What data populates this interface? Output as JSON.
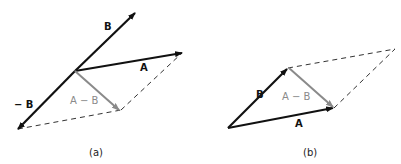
{
  "colors": {
    "vector": "#111111",
    "difference": "#8a8a8a",
    "dashed": "#333333",
    "background": "#ffffff"
  },
  "panels": [
    {
      "caption": "(a)",
      "labels": {
        "B": "B",
        "A": "A",
        "negB": "− B",
        "diff": "A − B"
      },
      "points": {
        "origin": [
          75,
          71
        ],
        "B_tip": [
          135,
          13
        ],
        "A_tip": [
          182,
          53
        ],
        "negB_tip": [
          18,
          129
        ],
        "diff_tip": [
          119,
          110
        ]
      }
    },
    {
      "caption": "(b)",
      "labels": {
        "B": "B",
        "A": "A",
        "diff": "A − B"
      },
      "points": {
        "origin": [
          228,
          128
        ],
        "B_tip": [
          288,
          68
        ],
        "A_tip": [
          334,
          108
        ],
        "far_corner": [
          395,
          49
        ]
      }
    }
  ]
}
